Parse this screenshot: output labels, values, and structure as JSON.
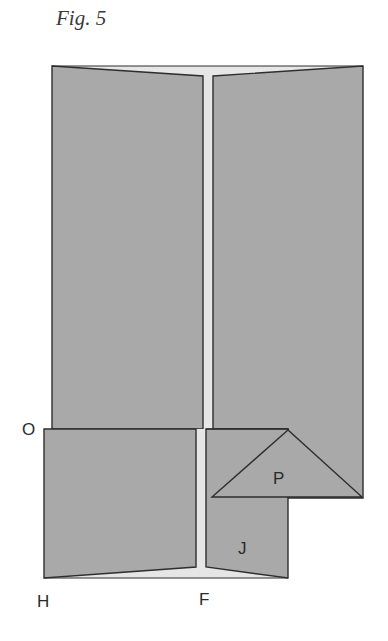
{
  "figure": {
    "title": "Fig. 5",
    "labels": {
      "O": "O",
      "P": "P",
      "J": "J",
      "H": "H",
      "F": "F"
    },
    "colors": {
      "panel_fill": "#a9a9a9",
      "gap_fill": "#e6e6e6",
      "stroke": "#2e2e2e"
    }
  }
}
